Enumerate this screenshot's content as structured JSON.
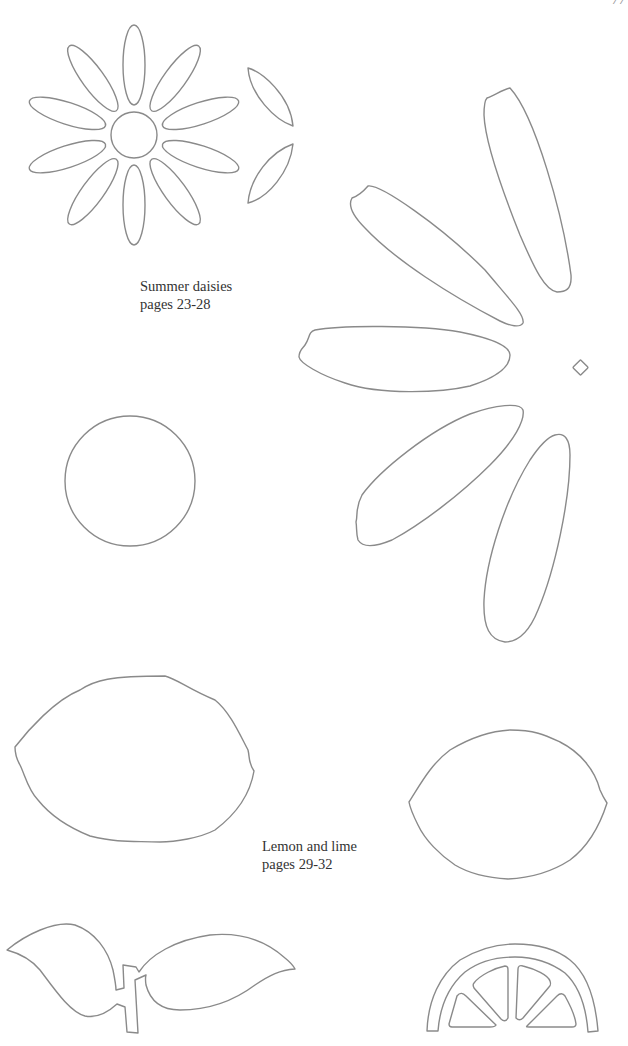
{
  "page": {
    "page_number": "77",
    "background": "#ffffff",
    "stroke_color": "#8a8a8a"
  },
  "sections": {
    "daisies": {
      "title": "Summer daisies",
      "pages": "pages 23-28",
      "templates": [
        "daisy-flower-10-petals",
        "small-leaf-upper",
        "small-leaf-lower",
        "large-petal-x5",
        "small-diamond",
        "daisy-center-circle"
      ]
    },
    "lemon_lime": {
      "title": "Lemon and lime",
      "pages": "pages 29-32",
      "templates": [
        "lemon-outline",
        "lime-outline",
        "leaf-pair-with-stem",
        "citrus-half-slice"
      ]
    }
  }
}
